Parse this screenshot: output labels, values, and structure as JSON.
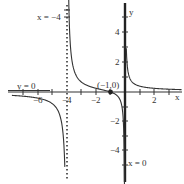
{
  "chart_data": {
    "type": "line",
    "title": "",
    "function": "f(x) = (x+1)/(x(x+4))",
    "xlabel": "x",
    "ylabel": "y",
    "xlim": [
      -8,
      3
    ],
    "ylim": [
      -6,
      6
    ],
    "x_ticks": [
      -6,
      -4,
      -2,
      2
    ],
    "y_ticks": [
      4,
      2,
      -2,
      -4
    ],
    "asymptotes": [
      {
        "type": "vertical",
        "label": "x = -4",
        "value": -4,
        "style": "dotted"
      },
      {
        "type": "vertical",
        "label": "x = 0",
        "value": 0,
        "style": "solid-thick"
      },
      {
        "type": "horizontal",
        "label": "y = 0",
        "value": 0,
        "style": "solid-thick"
      }
    ],
    "annotations": [
      {
        "label": "(-1,0)",
        "x": -1,
        "y": 0,
        "marker": "filled-dot"
      }
    ],
    "grid": false,
    "series": [
      {
        "name": "f(x)",
        "color": "#333333"
      }
    ]
  },
  "labels": {
    "x_axis": "x",
    "y_axis": "y",
    "asym_x_neg4": "x = −4",
    "asym_x_0": "x = 0",
    "asym_y_0": "y = 0",
    "zero_point": "(−1,0)",
    "tick_x_neg6": "−6",
    "tick_x_neg4": "−4",
    "tick_x_neg2": "−2",
    "tick_x_2": "2",
    "tick_y_4": "4",
    "tick_y_2": "2",
    "tick_y_neg2": "−2",
    "tick_y_neg4": "−4"
  }
}
